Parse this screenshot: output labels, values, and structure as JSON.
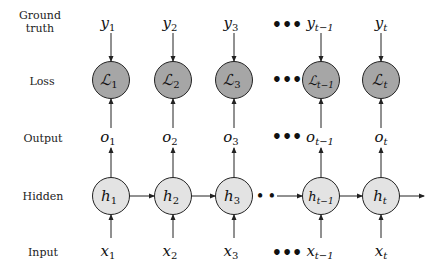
{
  "diagram": {
    "type": "unrolled-rnn",
    "row_labels": {
      "ground_truth_1": "Ground",
      "ground_truth_2": "truth",
      "loss": "Loss",
      "output": "Output",
      "hidden": "Hidden",
      "input": "Input"
    },
    "ellipsis": "•••",
    "hidden_ellipsis": "• •",
    "columns": [
      {
        "y": "y",
        "y_sub": "1",
        "L": "ℒ",
        "L_sub": "1",
        "o": "o",
        "o_sub": "1",
        "h": "h",
        "h_sub": "1",
        "x": "x",
        "x_sub": "1"
      },
      {
        "y": "y",
        "y_sub": "2",
        "L": "ℒ",
        "L_sub": "2",
        "o": "o",
        "o_sub": "2",
        "h": "h",
        "h_sub": "2",
        "x": "x",
        "x_sub": "2"
      },
      {
        "y": "y",
        "y_sub": "3",
        "L": "ℒ",
        "L_sub": "3",
        "o": "o",
        "o_sub": "3",
        "h": "h",
        "h_sub": "3",
        "x": "x",
        "x_sub": "3"
      },
      {
        "y": "y",
        "y_sub": "t−1",
        "L": "ℒ",
        "L_sub": "t−1",
        "o": "o",
        "o_sub": "t−1",
        "h": "h",
        "h_sub": "t−1",
        "x": "x",
        "x_sub": "t−1"
      },
      {
        "y": "y",
        "y_sub": "t",
        "L": "ℒ",
        "L_sub": "t",
        "o": "o",
        "o_sub": "t",
        "h": "h",
        "h_sub": "t",
        "x": "x",
        "x_sub": "t"
      }
    ],
    "colors": {
      "loss_node_fill": "#a6a6a6",
      "hidden_node_fill": "#e3e3e3",
      "stroke": "#222222"
    }
  }
}
